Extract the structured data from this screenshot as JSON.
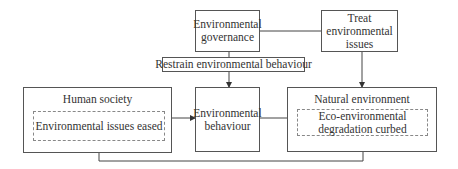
{
  "diagram": {
    "nodes": {
      "governance": "Environmental governance",
      "treat": "Treat environmental issues",
      "restrain": "Restrain environmental behaviour",
      "human_society": {
        "title": "Human society",
        "inner": "Environmental issues eased"
      },
      "behaviour": "Environmental behaviour",
      "natural_environment": {
        "title": "Natural environment",
        "inner": "Eco-environmental degradation curbed"
      }
    },
    "edges": [
      {
        "from": "governance",
        "to": "treat",
        "type": "line"
      },
      {
        "from": "governance",
        "to": "behaviour",
        "label": "Restrain environmental behaviour",
        "type": "arrow"
      },
      {
        "from": "treat",
        "to": "natural_environment",
        "type": "arrow"
      },
      {
        "from": "human_society",
        "to": "behaviour",
        "type": "arrow"
      },
      {
        "from": "behaviour",
        "to": "natural_environment",
        "type": "arrow"
      },
      {
        "from": "natural_environment",
        "to": "human_society",
        "type": "feedback-arrow"
      }
    ]
  }
}
